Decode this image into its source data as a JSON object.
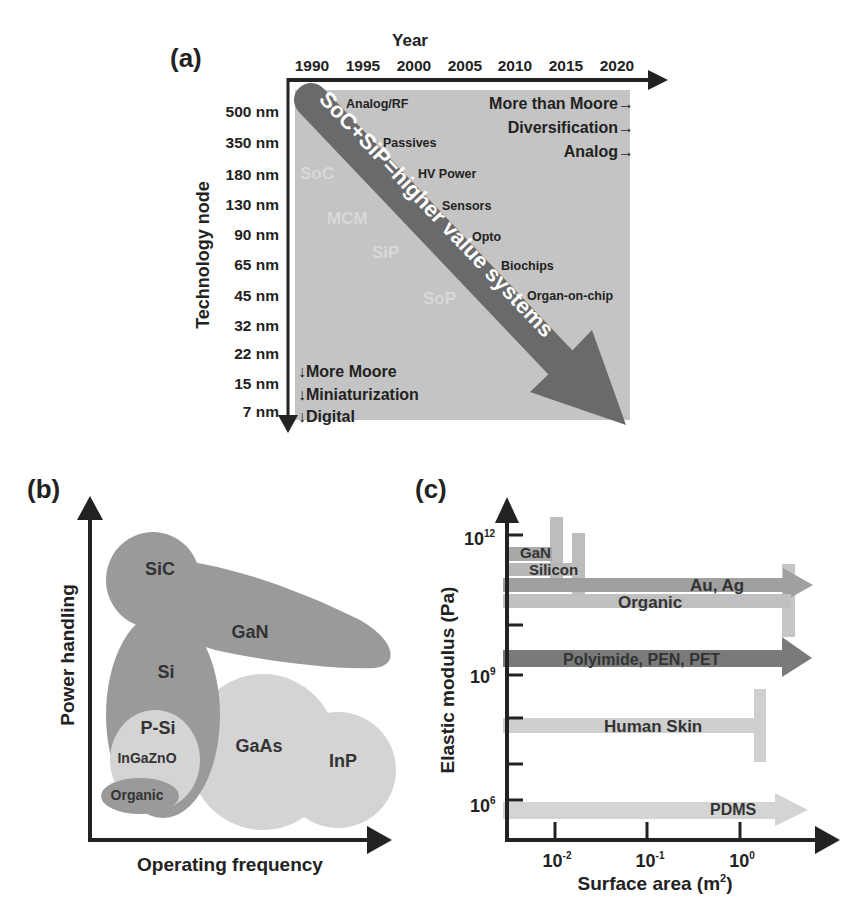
{
  "panel_a": {
    "label": "(a)",
    "x_axis_title": "Year",
    "years": [
      "1990",
      "1995",
      "2000",
      "2005",
      "2010",
      "2015",
      "2020"
    ],
    "y_axis_title": "Technology node",
    "nodes": [
      "500 nm",
      "350 nm",
      "180 nm",
      "130 nm",
      "90 nm",
      "65 nm",
      "45 nm",
      "32 nm",
      "22 nm",
      "15 nm",
      "7 nm"
    ],
    "big_arrow_text": "SoC+SiP=higher value systems",
    "diversification_items": [
      "Analog/RF",
      "Passives",
      "HV Power",
      "Sensors",
      "Opto",
      "Biochips",
      "Organ-on-chip"
    ],
    "faint_labels": [
      "SoC",
      "MCM",
      "SiP",
      "SoP"
    ],
    "more_than_moore": [
      "More than Moore→",
      "Diversification→",
      "Analog→"
    ],
    "more_moore": [
      "↓More Moore",
      "↓Miniaturization",
      "↓Digital"
    ]
  },
  "panel_b": {
    "label": "(b)",
    "y_axis_title": "Power handling",
    "x_axis_title": "Operating frequency",
    "materials": [
      "SiC",
      "GaN",
      "Si",
      "P-Si",
      "InGaZnO",
      "GaAs",
      "InP",
      "Organic"
    ]
  },
  "panel_c": {
    "label": "(c)",
    "y_axis_title": "Elastic modulus (Pa)",
    "x_axis_title": "Surface area (m",
    "x_axis_sup": "2",
    "x_axis_close": ")",
    "y_ticks": [
      {
        "base": "10",
        "exp": "12"
      },
      {
        "base": "10",
        "exp": "9"
      },
      {
        "base": "10",
        "exp": "6"
      }
    ],
    "x_ticks": [
      {
        "base": "10",
        "exp": "-2"
      },
      {
        "base": "10",
        "exp": "-1"
      },
      {
        "base": "10",
        "exp": "0"
      }
    ],
    "materials": [
      "GaN",
      "Silicon",
      "Au, Ag",
      "Organic",
      "Polyimide, PEN, PET",
      "Human Skin",
      "PDMS"
    ]
  },
  "colors": {
    "axis": "#222222",
    "panel_a_bg": "#c4c4c4",
    "big_arrow": "#6a6a6a",
    "dark_blob": "#9a9a9a",
    "light_blob": "#d4d4d4",
    "mid_blob": "#b8b8b8",
    "bar_dark": "#7a7a7a",
    "bar_mid": "#a8a8a8",
    "bar_light": "#cfcfcf"
  }
}
